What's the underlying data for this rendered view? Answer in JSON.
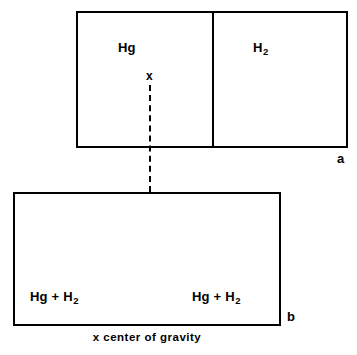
{
  "figure": {
    "background_color": "#ffffff",
    "stroke_color": "#000000",
    "caption": "x center of gravity"
  },
  "panels": {
    "top": {
      "letter": "a",
      "compartments": [
        {
          "name": "mercury",
          "formula": "Hg",
          "subscript": ""
        },
        {
          "name": "hydrogen",
          "formula": "H",
          "subscript": "2"
        }
      ],
      "marker": {
        "symbol": "x",
        "meaning": "center of gravity"
      }
    },
    "bottom": {
      "letter": "b",
      "compartments": [
        {
          "name": "mixture-left",
          "formula": "Hg + H",
          "subscript": "2"
        },
        {
          "name": "mixture-right",
          "formula": "Hg + H",
          "subscript": "2"
        }
      ]
    }
  }
}
